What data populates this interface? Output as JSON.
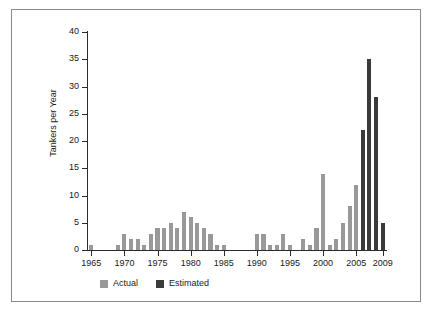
{
  "chart_data": {
    "type": "bar",
    "title": "",
    "xlabel": "",
    "ylabel": "Tankers per Year",
    "ylim": [
      0,
      40
    ],
    "ytick_step": 5,
    "yticks": [
      "0",
      "5",
      "10",
      "15",
      "20",
      "25",
      "30",
      "35",
      "40"
    ],
    "xlim": [
      1965,
      2009
    ],
    "xticks": [
      "1965",
      "1970",
      "1975",
      "1980",
      "1985",
      "1990",
      "1995",
      "2000",
      "2005",
      "2009"
    ],
    "grid": false,
    "legend_position": "bottom",
    "categories": [
      1965,
      1966,
      1967,
      1968,
      1969,
      1970,
      1971,
      1972,
      1973,
      1974,
      1975,
      1976,
      1977,
      1978,
      1979,
      1980,
      1981,
      1982,
      1983,
      1984,
      1985,
      1986,
      1987,
      1988,
      1989,
      1990,
      1991,
      1992,
      1993,
      1994,
      1995,
      1996,
      1997,
      1998,
      1999,
      2000,
      2001,
      2002,
      2003,
      2004,
      2005,
      2006,
      2007,
      2008,
      2009
    ],
    "series": [
      {
        "name": "Actual",
        "color": "#999999",
        "values": [
          1,
          0,
          0,
          0,
          1,
          3,
          2,
          2,
          1,
          3,
          4,
          4,
          5,
          4,
          7,
          6,
          5,
          4,
          3,
          1,
          1,
          0,
          0,
          0,
          0,
          3,
          3,
          1,
          1,
          3,
          1,
          0,
          2,
          1,
          4,
          14,
          1,
          2,
          5,
          8,
          12,
          20,
          0,
          0,
          0
        ]
      },
      {
        "name": "Estimated",
        "color": "#3a3a3a",
        "values": [
          0,
          0,
          0,
          0,
          0,
          0,
          0,
          0,
          0,
          0,
          0,
          0,
          0,
          0,
          0,
          0,
          0,
          0,
          0,
          0,
          0,
          0,
          0,
          0,
          0,
          0,
          0,
          0,
          0,
          0,
          0,
          0,
          0,
          0,
          0,
          0,
          0,
          0,
          0,
          0,
          0,
          22,
          35,
          28,
          5
        ]
      }
    ]
  },
  "legend": {
    "items": [
      {
        "label": "Actual",
        "color": "#999999"
      },
      {
        "label": "Estimated",
        "color": "#3a3a3a"
      }
    ]
  }
}
